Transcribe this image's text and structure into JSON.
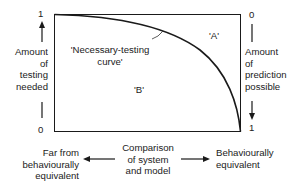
{
  "diagram": {
    "left_axis": {
      "top_value": "1",
      "bottom_value": "0",
      "label": [
        "Amount",
        "of",
        "testing",
        "needed"
      ]
    },
    "right_axis": {
      "top_value": "0",
      "bottom_value": "1",
      "label": [
        "Amount",
        "of",
        "prediction",
        "possible"
      ]
    },
    "curve_label": [
      "'Necessary-testing",
      "curve'"
    ],
    "region_a": "'A'",
    "region_b": "'B'",
    "bottom": {
      "left_label": [
        "Far from",
        "behaviourally",
        "equivalent"
      ],
      "center_label": [
        "Comparison",
        "of system",
        "and model"
      ],
      "right_label": [
        "Behaviourally",
        "equivalent"
      ]
    },
    "colors": {
      "line": "#1a1a1a",
      "text": "#222222",
      "background": "#ffffff"
    }
  }
}
